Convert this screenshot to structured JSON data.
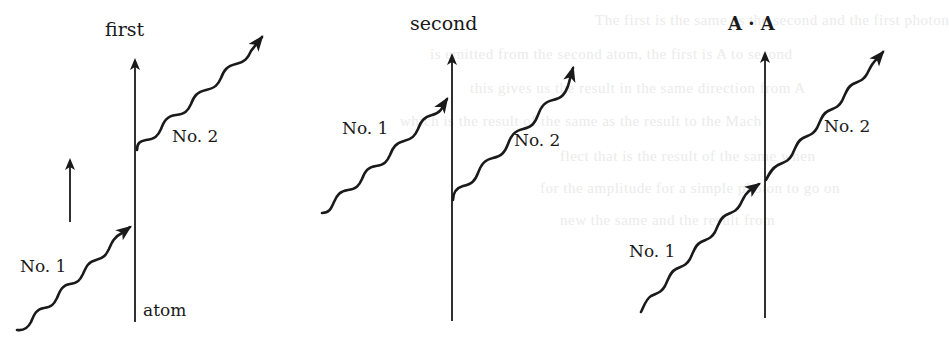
{
  "figure": {
    "panels": [
      {
        "id": "first",
        "title": "first",
        "axis_label_bottom": "atom",
        "photon_labels": [
          "No. 1",
          "No. 2"
        ]
      },
      {
        "id": "second",
        "title": "second",
        "photon_labels": [
          "No. 1",
          "No. 2"
        ]
      },
      {
        "id": "amplitude-product",
        "title": "A · A",
        "photon_labels": [
          "No. 1",
          "No. 2"
        ]
      }
    ],
    "colors": {
      "ink": "#1a1a1a",
      "background": "#ffffff",
      "bleed_through_text": "#ebebeb"
    }
  },
  "bleed_through": [
    "The first is the same as the second and the first photon",
    "is emitted from the second atom, the first is A to second",
    "this gives us the result in the same direction from A",
    "which is the result of the same as the result to the Mach",
    "flect that is the result of the same when",
    "for the amplitude for a simple photon to go on",
    "new the same and the result from"
  ]
}
